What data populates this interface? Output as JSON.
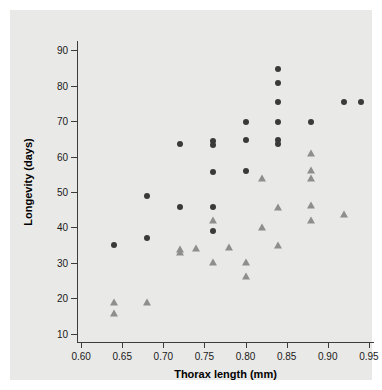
{
  "chart_data": {
    "type": "scatter",
    "title": "",
    "xlabel": "Thorax length (mm)",
    "ylabel": "Longevity (days)",
    "xlim": [
      0.595,
      0.955
    ],
    "ylim": [
      8,
      92
    ],
    "xticks": [
      "0.60",
      "0.65",
      "0.70",
      "0.75",
      "0.80",
      "0.85",
      "0.90",
      "0.95"
    ],
    "xtick_values": [
      0.6,
      0.65,
      0.7,
      0.75,
      0.8,
      0.85,
      0.9,
      0.95
    ],
    "yticks": [
      "10",
      "20",
      "30",
      "40",
      "50",
      "60",
      "70",
      "80",
      "90"
    ],
    "ytick_values": [
      10,
      20,
      30,
      40,
      50,
      60,
      70,
      80,
      90
    ],
    "grid": false,
    "legend_position": "none",
    "series": [
      {
        "name": "circle-markers",
        "marker": "circle",
        "color": "#3a3a3a",
        "points": [
          [
            0.64,
            35.0
          ],
          [
            0.68,
            48.8
          ],
          [
            0.68,
            37.0
          ],
          [
            0.72,
            63.6
          ],
          [
            0.72,
            45.8
          ],
          [
            0.76,
            64.5
          ],
          [
            0.76,
            63.3
          ],
          [
            0.76,
            55.7
          ],
          [
            0.76,
            45.8
          ],
          [
            0.76,
            39.0
          ],
          [
            0.8,
            69.7
          ],
          [
            0.8,
            64.7
          ],
          [
            0.8,
            55.8
          ],
          [
            0.84,
            84.8
          ],
          [
            0.84,
            80.8
          ],
          [
            0.84,
            75.5
          ],
          [
            0.84,
            69.7
          ],
          [
            0.84,
            64.7
          ],
          [
            0.84,
            63.4
          ],
          [
            0.88,
            69.6
          ],
          [
            0.92,
            75.5
          ],
          [
            0.94,
            75.5
          ]
        ]
      },
      {
        "name": "triangle-markers",
        "marker": "triangle",
        "color": "#8e8e8e",
        "points": [
          [
            0.64,
            19.0
          ],
          [
            0.64,
            16.0
          ],
          [
            0.68,
            19.0
          ],
          [
            0.72,
            34.0
          ],
          [
            0.72,
            33.2
          ],
          [
            0.74,
            34.3
          ],
          [
            0.76,
            42.0
          ],
          [
            0.76,
            30.3
          ],
          [
            0.78,
            34.4
          ],
          [
            0.8,
            30.4
          ],
          [
            0.8,
            26.3
          ],
          [
            0.82,
            54.0
          ],
          [
            0.82,
            40.0
          ],
          [
            0.84,
            45.9
          ],
          [
            0.84,
            35.1
          ],
          [
            0.88,
            61.0
          ],
          [
            0.88,
            56.2
          ],
          [
            0.88,
            54.0
          ],
          [
            0.88,
            46.3
          ],
          [
            0.88,
            42.0
          ],
          [
            0.92,
            43.9
          ]
        ]
      }
    ]
  }
}
